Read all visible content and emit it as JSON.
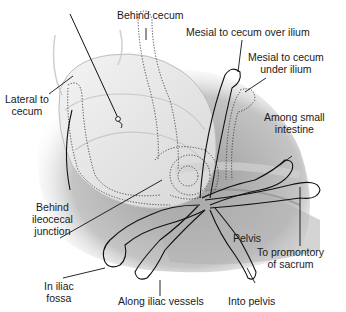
{
  "figure": {
    "colors": {
      "background": "#ffffff",
      "pelvis_shadow": "#a8a8a8",
      "organ_fill": "#e6e6e6",
      "organ_stroke": "#bdbdbd",
      "outline": "#111111",
      "dotted": "#333333"
    }
  },
  "labels": {
    "behind_cecum": {
      "line1": "Behind cecum"
    },
    "mesial_over_ilium": {
      "line1": "Mesial to cecum over ilium"
    },
    "mesial_under_ilium": {
      "line1": "Mesial to cecum",
      "line2": "under ilium"
    },
    "lateral_to_cecum": {
      "line1": "Lateral to",
      "line2": "cecum"
    },
    "among_small_intestine": {
      "line1": "Among small",
      "line2": "intestine"
    },
    "behind_ileocecal": {
      "line1": "Behind",
      "line2": "ileocecal",
      "line3": "junction"
    },
    "pelvis": {
      "line1": "Pelvis"
    },
    "to_promontory": {
      "line1": "To promontory",
      "line2": "of sacrum"
    },
    "in_iliac_fossa": {
      "line1": "In iliac",
      "line2": "fossa"
    },
    "along_iliac_vessels": {
      "line1": "Along iliac vessels"
    },
    "into_pelvis": {
      "line1": "Into pelvis"
    }
  }
}
